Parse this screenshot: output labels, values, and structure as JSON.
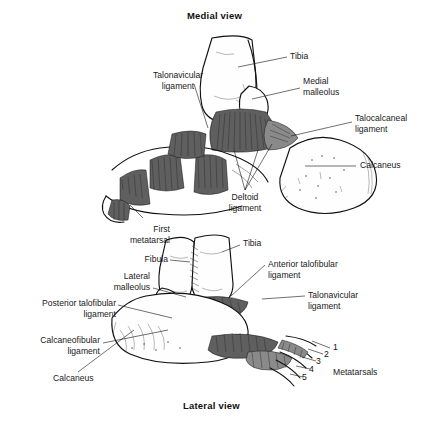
{
  "figure": {
    "medial_caption": "Medial view",
    "lateral_caption": "Lateral view"
  },
  "medial_view": {
    "labels": [
      {
        "key": "tibia",
        "text": "Tibia"
      },
      {
        "key": "medial_malleolus",
        "text": "Medial\nmalleolus"
      },
      {
        "key": "talocalcaneal_ligament",
        "text": "Talocalcaneal\nligament"
      },
      {
        "key": "calcaneus",
        "text": "Calcaneus"
      },
      {
        "key": "talonavicular_ligament",
        "text": "Talonavicular\nligament"
      },
      {
        "key": "deltoid_ligament",
        "text": "Deltoid\nligament"
      }
    ]
  },
  "lateral_view": {
    "labels": [
      {
        "key": "first_metatarsal",
        "text": "First\nmetatarsal"
      },
      {
        "key": "fibula",
        "text": "Fibula"
      },
      {
        "key": "lateral_malleolus",
        "text": "Lateral\nmalleolus"
      },
      {
        "key": "posterior_talofibular_ligament",
        "text": "Posterior talofibular\nligament"
      },
      {
        "key": "calcaneofibular_ligament",
        "text": "Calcaneofibular\nligament"
      },
      {
        "key": "calcaneus",
        "text": "Calcaneus"
      },
      {
        "key": "tibia",
        "text": "Tibia"
      },
      {
        "key": "anterior_talofibular_ligament",
        "text": "Anterior talofibular\nligament"
      },
      {
        "key": "talonavicular_ligament",
        "text": "Talonavicular\nligament"
      },
      {
        "key": "metatarsals",
        "text": "Metatarsals"
      }
    ],
    "metatarsal_numbers": [
      "1",
      "2",
      "3",
      "4",
      "5"
    ]
  },
  "colors": {
    "ink": "#111111",
    "paper": "#ffffff",
    "ligament_dark": "#5f5f5f",
    "ligament_mid": "#8a8a8a"
  }
}
